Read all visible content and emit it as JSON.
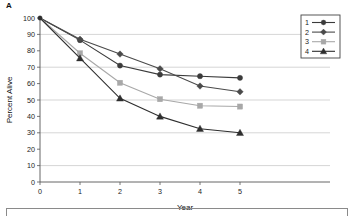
{
  "panel": {
    "label": "A"
  },
  "chart_data": {
    "type": "line",
    "title": "",
    "xlabel": "Year",
    "ylabel": "Percent Alive",
    "x": [
      0,
      1,
      2,
      3,
      4,
      5
    ],
    "xticklabels": [
      "0",
      "1",
      "2",
      "3",
      "4",
      "5"
    ],
    "yticklabels": [
      "0",
      "10",
      "20",
      "30",
      "40",
      "50",
      "60",
      "70",
      "80",
      "90",
      "100"
    ],
    "yticks": [
      0,
      10,
      20,
      30,
      40,
      50,
      60,
      70,
      80,
      90,
      100
    ],
    "xlim": [
      0,
      5.6
    ],
    "ylim": [
      0,
      100
    ],
    "grid": "horizontal-major-every-20",
    "gridlines": [
      10,
      30,
      50,
      70,
      90
    ],
    "legend_position": "top-right",
    "series": [
      {
        "name": "1",
        "marker": "circle",
        "color": "#3b3b3b",
        "values": [
          100,
          86.5,
          71,
          65.5,
          64.5,
          63.5
        ]
      },
      {
        "name": "2",
        "marker": "diamond",
        "color": "#4a4a4a",
        "values": [
          100,
          87,
          78,
          69,
          58.5,
          55
        ]
      },
      {
        "name": "3",
        "marker": "square",
        "color": "#a8a8a8",
        "values": [
          100,
          78.5,
          60.5,
          50.5,
          46.5,
          46
        ]
      },
      {
        "name": "4",
        "marker": "triangle",
        "color": "#2e2e2e",
        "values": [
          100,
          75.5,
          51,
          40,
          32.5,
          30
        ]
      }
    ]
  },
  "legend": {
    "items": [
      {
        "label": "1",
        "marker": "circle",
        "color": "#3b3b3b"
      },
      {
        "label": "2",
        "marker": "diamond",
        "color": "#4a4a4a"
      },
      {
        "label": "3",
        "marker": "square",
        "color": "#a8a8a8"
      },
      {
        "label": "4",
        "marker": "triangle",
        "color": "#2e2e2e"
      }
    ]
  }
}
